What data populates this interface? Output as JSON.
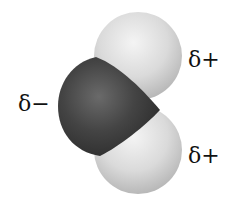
{
  "molecule": {
    "name": "water",
    "atoms": [
      {
        "element": "O",
        "role": "oxygen",
        "charge_label": "δ−",
        "color": "#3a3a3a"
      },
      {
        "element": "H",
        "role": "hydrogen-top",
        "charge_label": "δ+",
        "color": "#dcdcdc"
      },
      {
        "element": "H",
        "role": "hydrogen-bottom",
        "charge_label": "δ+",
        "color": "#dcdcdc"
      }
    ]
  },
  "labels": {
    "oxygen": "δ−",
    "hydrogen_top": "δ+",
    "hydrogen_bottom": "δ+"
  }
}
